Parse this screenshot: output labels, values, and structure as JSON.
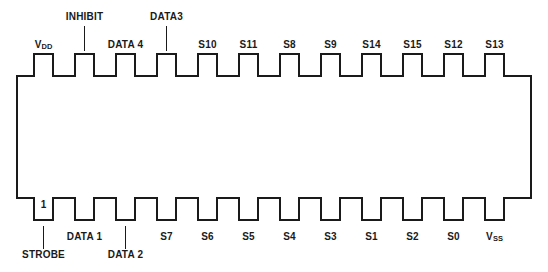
{
  "diagram": {
    "kind": "dip-package-pinout",
    "package_pin_count": 24,
    "pin_one_marker": "1",
    "line_color": "#1a1a1a",
    "background_color": "#ffffff",
    "top_pins": [
      {
        "label": "V<sub>DD</sub>",
        "plain": "VDD",
        "x": 33,
        "label_row": "near",
        "leader": false
      },
      {
        "label": "INHIBIT",
        "plain": "INHIBIT",
        "x": 74,
        "label_row": "far",
        "leader": true
      },
      {
        "label": "DATA 4",
        "plain": "DATA 4",
        "x": 115,
        "label_row": "near",
        "leader": false
      },
      {
        "label": "DATA3",
        "plain": "DATA3",
        "x": 156,
        "label_row": "far",
        "leader": true
      },
      {
        "label": "S10",
        "plain": "S10",
        "x": 197,
        "label_row": "near",
        "leader": false
      },
      {
        "label": "S11",
        "plain": "S11",
        "x": 238,
        "label_row": "near",
        "leader": false
      },
      {
        "label": "S8",
        "plain": "S8",
        "x": 279,
        "label_row": "near",
        "leader": false
      },
      {
        "label": "S9",
        "plain": "S9",
        "x": 320,
        "label_row": "near",
        "leader": false
      },
      {
        "label": "S14",
        "plain": "S14",
        "x": 361,
        "label_row": "near",
        "leader": false
      },
      {
        "label": "S15",
        "plain": "S15",
        "x": 402,
        "label_row": "near",
        "leader": false
      },
      {
        "label": "S12",
        "plain": "S12",
        "x": 443,
        "label_row": "near",
        "leader": false
      },
      {
        "label": "S13",
        "plain": "S13",
        "x": 484,
        "label_row": "near",
        "leader": false
      }
    ],
    "bottom_pins": [
      {
        "label": "STROBE",
        "plain": "STROBE",
        "x": 33,
        "label_row": "far",
        "leader": true,
        "pin_number": "1"
      },
      {
        "label": "DATA 1",
        "plain": "DATA 1",
        "x": 74,
        "label_row": "near",
        "leader": false
      },
      {
        "label": "DATA  2",
        "plain": "DATA 2",
        "x": 115,
        "label_row": "far",
        "leader": true
      },
      {
        "label": "S7",
        "plain": "S7",
        "x": 156,
        "label_row": "near",
        "leader": false
      },
      {
        "label": "S6",
        "plain": "S6",
        "x": 197,
        "label_row": "near",
        "leader": false
      },
      {
        "label": "S5",
        "plain": "S5",
        "x": 238,
        "label_row": "near",
        "leader": false
      },
      {
        "label": "S4",
        "plain": "S4",
        "x": 279,
        "label_row": "near",
        "leader": false
      },
      {
        "label": "S3",
        "plain": "S3",
        "x": 320,
        "label_row": "near",
        "leader": false
      },
      {
        "label": "S1",
        "plain": "S1",
        "x": 361,
        "label_row": "near",
        "leader": false
      },
      {
        "label": "S2",
        "plain": "S2",
        "x": 402,
        "label_row": "near",
        "leader": false
      },
      {
        "label": "S0",
        "plain": "S0",
        "x": 443,
        "label_row": "near",
        "leader": false
      },
      {
        "label": "V<sub>SS</sub>",
        "plain": "VSS",
        "x": 484,
        "label_row": "near",
        "leader": false
      }
    ]
  }
}
